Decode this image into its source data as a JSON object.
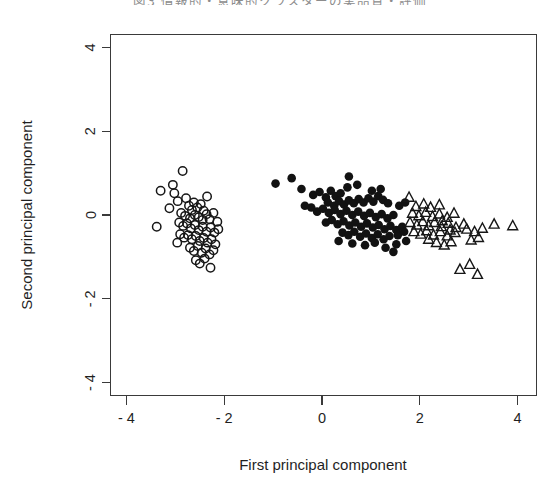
{
  "caption": {
    "text": "図3  情報的・意味的クラスターの実品質・評価"
  },
  "chart_data": {
    "type": "scatter",
    "title": "",
    "xlabel": "First principal component",
    "ylabel": "Second principal component",
    "xlim": [
      -4.7,
      4.4
    ],
    "ylim": [
      -4.6,
      4.3
    ],
    "xticks": [
      -4,
      -2,
      0,
      2,
      4
    ],
    "xtick_labels": [
      "- 4",
      "- 2",
      "0",
      "2",
      "4"
    ],
    "yticks": [
      -4,
      -2,
      0,
      2,
      4
    ],
    "ytick_labels": [
      "- 4",
      "- 2",
      "0",
      "2",
      "4"
    ],
    "grid": false,
    "legend": null,
    "frame": "box",
    "series": [
      {
        "name": "cluster-1",
        "marker": "open-circle",
        "color": "#171717",
        "points": [
          [
            -2.85,
            1.05
          ],
          [
            -3.3,
            0.58
          ],
          [
            -3.02,
            0.52
          ],
          [
            -2.95,
            0.33
          ],
          [
            -3.12,
            0.16
          ],
          [
            -2.78,
            0.4
          ],
          [
            -2.72,
            0.22
          ],
          [
            -2.62,
            0.3
          ],
          [
            -2.66,
            0.12
          ],
          [
            -2.55,
            0.18
          ],
          [
            -2.48,
            0.26
          ],
          [
            -2.42,
            0.1
          ],
          [
            -2.88,
            0.05
          ],
          [
            -2.8,
            -0.02
          ],
          [
            -2.7,
            -0.08
          ],
          [
            -2.6,
            0.0
          ],
          [
            -2.52,
            -0.05
          ],
          [
            -2.44,
            -0.12
          ],
          [
            -2.36,
            0.02
          ],
          [
            -2.3,
            -0.1
          ],
          [
            -2.22,
            0.05
          ],
          [
            -3.38,
            -0.28
          ],
          [
            -2.92,
            -0.18
          ],
          [
            -2.84,
            -0.26
          ],
          [
            -2.76,
            -0.2
          ],
          [
            -2.68,
            -0.32
          ],
          [
            -2.6,
            -0.24
          ],
          [
            -2.52,
            -0.36
          ],
          [
            -2.44,
            -0.28
          ],
          [
            -2.36,
            -0.4
          ],
          [
            -2.28,
            -0.3
          ],
          [
            -2.2,
            -0.42
          ],
          [
            -2.12,
            -0.34
          ],
          [
            -2.9,
            -0.46
          ],
          [
            -2.82,
            -0.54
          ],
          [
            -2.74,
            -0.48
          ],
          [
            -2.66,
            -0.58
          ],
          [
            -2.58,
            -0.5
          ],
          [
            -2.5,
            -0.62
          ],
          [
            -2.42,
            -0.55
          ],
          [
            -2.34,
            -0.66
          ],
          [
            -2.26,
            -0.58
          ],
          [
            -2.18,
            -0.7
          ],
          [
            -2.7,
            -0.78
          ],
          [
            -2.62,
            -0.86
          ],
          [
            -2.54,
            -0.74
          ],
          [
            -2.46,
            -0.9
          ],
          [
            -2.38,
            -0.8
          ],
          [
            -2.3,
            -0.94
          ],
          [
            -2.22,
            -0.84
          ],
          [
            -2.58,
            -1.08
          ],
          [
            -2.5,
            -1.16
          ],
          [
            -2.4,
            -1.04
          ],
          [
            -2.28,
            -1.26
          ],
          [
            -3.05,
            0.72
          ],
          [
            -2.35,
            0.44
          ],
          [
            -2.14,
            -0.16
          ],
          [
            -2.96,
            -0.66
          ]
        ]
      },
      {
        "name": "cluster-2",
        "marker": "filled-circle",
        "color": "#121212",
        "points": [
          [
            -0.95,
            0.75
          ],
          [
            -0.62,
            0.88
          ],
          [
            -0.42,
            0.62
          ],
          [
            0.55,
            0.92
          ],
          [
            -0.18,
            0.48
          ],
          [
            -0.05,
            0.55
          ],
          [
            0.08,
            0.42
          ],
          [
            0.18,
            0.58
          ],
          [
            0.28,
            0.45
          ],
          [
            0.38,
            0.52
          ],
          [
            0.12,
            0.3
          ],
          [
            0.25,
            0.22
          ],
          [
            0.35,
            0.33
          ],
          [
            0.45,
            0.25
          ],
          [
            0.55,
            0.35
          ],
          [
            0.65,
            0.28
          ],
          [
            0.75,
            0.38
          ],
          [
            0.85,
            0.3
          ],
          [
            0.95,
            0.4
          ],
          [
            1.05,
            0.32
          ],
          [
            1.15,
            0.45
          ],
          [
            1.25,
            0.36
          ],
          [
            1.35,
            0.28
          ],
          [
            -0.22,
            0.18
          ],
          [
            -0.1,
            0.08
          ],
          [
            0.02,
            0.15
          ],
          [
            0.14,
            0.05
          ],
          [
            0.26,
            0.12
          ],
          [
            0.38,
            0.02
          ],
          [
            0.5,
            0.1
          ],
          [
            0.62,
            0.0
          ],
          [
            0.74,
            0.08
          ],
          [
            0.86,
            -0.02
          ],
          [
            0.98,
            0.05
          ],
          [
            1.1,
            -0.05
          ],
          [
            1.22,
            0.02
          ],
          [
            1.34,
            -0.08
          ],
          [
            1.46,
            0.0
          ],
          [
            1.58,
            0.22
          ],
          [
            1.7,
            0.3
          ],
          [
            0.08,
            -0.18
          ],
          [
            0.2,
            -0.12
          ],
          [
            0.32,
            -0.22
          ],
          [
            0.44,
            -0.15
          ],
          [
            0.56,
            -0.25
          ],
          [
            0.68,
            -0.18
          ],
          [
            0.8,
            -0.28
          ],
          [
            0.92,
            -0.2
          ],
          [
            1.04,
            -0.3
          ],
          [
            1.16,
            -0.24
          ],
          [
            1.28,
            -0.34
          ],
          [
            1.4,
            -0.26
          ],
          [
            1.52,
            -0.36
          ],
          [
            1.64,
            -0.28
          ],
          [
            0.42,
            -0.42
          ],
          [
            0.54,
            -0.48
          ],
          [
            0.66,
            -0.4
          ],
          [
            0.78,
            -0.52
          ],
          [
            0.9,
            -0.44
          ],
          [
            1.02,
            -0.55
          ],
          [
            1.14,
            -0.46
          ],
          [
            1.26,
            -0.58
          ],
          [
            1.38,
            -0.5
          ],
          [
            0.62,
            -0.68
          ],
          [
            0.88,
            -0.72
          ],
          [
            1.08,
            -0.66
          ],
          [
            1.3,
            -0.78
          ],
          [
            1.52,
            -0.7
          ],
          [
            1.72,
            -0.62
          ],
          [
            0.52,
            0.66
          ],
          [
            0.72,
            0.72
          ],
          [
            1.02,
            0.58
          ],
          [
            1.2,
            0.62
          ],
          [
            -0.35,
            0.22
          ],
          [
            1.55,
            -0.48
          ],
          [
            1.68,
            -0.4
          ],
          [
            1.46,
            -0.88
          ],
          [
            0.34,
            -0.62
          ]
        ]
      },
      {
        "name": "cluster-3",
        "marker": "open-triangle",
        "color": "#171717",
        "points": [
          [
            1.78,
            0.42
          ],
          [
            1.92,
            0.2
          ],
          [
            2.08,
            0.26
          ],
          [
            2.22,
            0.18
          ],
          [
            2.4,
            0.24
          ],
          [
            1.85,
            0.04
          ],
          [
            1.98,
            -0.02
          ],
          [
            2.12,
            0.06
          ],
          [
            2.26,
            -0.04
          ],
          [
            2.4,
            0.02
          ],
          [
            2.56,
            -0.06
          ],
          [
            2.7,
            0.04
          ],
          [
            1.8,
            -0.18
          ],
          [
            1.94,
            -0.24
          ],
          [
            2.06,
            -0.16
          ],
          [
            2.18,
            -0.26
          ],
          [
            2.3,
            -0.18
          ],
          [
            2.44,
            -0.28
          ],
          [
            2.58,
            -0.2
          ],
          [
            2.74,
            -0.3
          ],
          [
            2.9,
            -0.22
          ],
          [
            1.88,
            -0.4
          ],
          [
            2.02,
            -0.46
          ],
          [
            2.14,
            -0.38
          ],
          [
            2.28,
            -0.48
          ],
          [
            2.42,
            -0.4
          ],
          [
            2.56,
            -0.5
          ],
          [
            2.72,
            -0.42
          ],
          [
            2.96,
            -0.34
          ],
          [
            3.12,
            -0.4
          ],
          [
            3.28,
            -0.32
          ],
          [
            3.52,
            -0.22
          ],
          [
            3.9,
            -0.26
          ],
          [
            2.34,
            -0.66
          ],
          [
            2.5,
            -0.72
          ],
          [
            2.64,
            -0.64
          ],
          [
            3.05,
            -0.6
          ],
          [
            3.2,
            -0.54
          ],
          [
            2.82,
            -1.3
          ],
          [
            3.02,
            -1.18
          ],
          [
            3.18,
            -1.42
          ],
          [
            2.18,
            -0.58
          ],
          [
            2.46,
            -0.14
          ],
          [
            2.62,
            -0.36
          ]
        ]
      }
    ]
  }
}
